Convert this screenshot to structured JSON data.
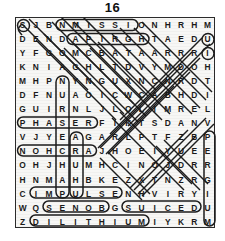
{
  "page": {
    "title": "16",
    "puzzle_type": "word-search",
    "grid_size": "15x15",
    "ink_color": "#1d1d1d",
    "paper_color": "#f7f7f5"
  },
  "grid": {
    "rows": [
      [
        "S",
        "J",
        "B",
        "N",
        "M",
        "I",
        "S",
        "S",
        "I",
        "O",
        "N",
        "H",
        "R",
        "H",
        "M"
      ],
      [
        "D",
        "E",
        "N",
        "D",
        "A",
        "P",
        "I",
        "R",
        "G",
        "H",
        "T",
        "A",
        "E",
        "D",
        "U"
      ],
      [
        "Y",
        "F",
        "G",
        "O",
        "M",
        "C",
        "B",
        "A",
        "T",
        "A",
        "A",
        "R",
        "R",
        "R",
        "I"
      ],
      [
        "K",
        "N",
        "I",
        "A",
        "G",
        "H",
        "L",
        "T",
        "D",
        "V",
        "Y",
        "M",
        "D",
        "O",
        "H"
      ],
      [
        "M",
        "H",
        "P",
        "N",
        "Y",
        "N",
        "G",
        "U",
        "X",
        "N",
        "C",
        "N",
        "R",
        "D",
        "T"
      ],
      [
        "D",
        "F",
        "N",
        "U",
        "A",
        "O",
        "I",
        "C",
        "W",
        "C",
        "A",
        "B",
        "H",
        "D",
        "I"
      ],
      [
        "G",
        "U",
        "I",
        "R",
        "N",
        "L",
        "J",
        "L",
        "O",
        "L",
        "I",
        "M",
        "R",
        "E",
        "L"
      ],
      [
        "P",
        "H",
        "A",
        "S",
        "E",
        "R",
        "F",
        "I",
        "K",
        "T",
        "S",
        "D",
        "A",
        "N",
        "V"
      ],
      [
        "V",
        "J",
        "Y",
        "E",
        "A",
        "G",
        "A",
        "R",
        "L",
        "P",
        "T",
        "F",
        "Z",
        "B",
        "P"
      ],
      [
        "N",
        "O",
        "H",
        "C",
        "R",
        "A",
        "J",
        "H",
        "O",
        "E",
        "I",
        "Y",
        "U",
        "E",
        "E"
      ],
      [
        "O",
        "H",
        "J",
        "H",
        "U",
        "M",
        "H",
        "C",
        "I",
        "N",
        "O",
        "J",
        "D",
        "R",
        "R"
      ],
      [
        "H",
        "N",
        "M",
        "A",
        "H",
        "B",
        "K",
        "E",
        "Z",
        "X",
        "T",
        "N",
        "Z",
        "R",
        "G"
      ],
      [
        "C",
        "I",
        "M",
        "P",
        "U",
        "L",
        "S",
        "E",
        "N",
        "H",
        "V",
        "I",
        "R",
        "Y",
        "I"
      ],
      [
        "W",
        "Q",
        "S",
        "E",
        "N",
        "O",
        "B",
        "G",
        "S",
        "U",
        "I",
        "C",
        "E",
        "D",
        "U"
      ],
      [
        "Z",
        "D",
        "I",
        "L",
        "I",
        "T",
        "H",
        "I",
        "U",
        "M",
        "I",
        "Y",
        "K",
        "R",
        "M"
      ]
    ]
  },
  "found_words": [
    {
      "word": "MISSION",
      "direction": "horizontal",
      "start_row": 0,
      "start_col": 3,
      "length": 8
    },
    {
      "word": "PIRGHTAE",
      "direction": "horizontal",
      "start_row": 1,
      "start_col": 4,
      "length": 10
    },
    {
      "word": "PHASER",
      "direction": "horizontal",
      "start_row": 7,
      "start_col": 0,
      "length": 6
    },
    {
      "word": "ARCHON",
      "direction": "horizontal-reverse",
      "start_row": 9,
      "start_col": 0,
      "length": 6
    },
    {
      "word": "IMPULSE",
      "direction": "horizontal",
      "start_row": 12,
      "start_col": 1,
      "length": 7
    },
    {
      "word": "SENOB",
      "direction": "horizontal",
      "start_row": 13,
      "start_col": 2,
      "length": 5
    },
    {
      "word": "SUICED",
      "direction": "horizontal",
      "start_row": 13,
      "start_col": 8,
      "length": 6
    },
    {
      "word": "DILITHIUM",
      "direction": "horizontal",
      "start_row": 14,
      "start_col": 1,
      "length": 9
    },
    {
      "word": "PERGIUM",
      "direction": "vertical",
      "start_row": 8,
      "start_col": 14,
      "length": 7
    }
  ]
}
